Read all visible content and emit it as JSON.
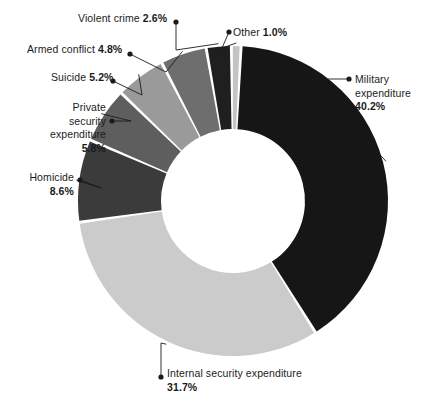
{
  "chart_data": {
    "type": "pie",
    "variant": "donut",
    "title": "",
    "subtitle": "",
    "xlabel": "",
    "ylabel": "",
    "units": "percent",
    "legend_position": "none",
    "grid": false,
    "label_style": "callout-with-leader-line-and-dot",
    "start_angle_deg": 3,
    "direction": "clockwise",
    "total": 99.9,
    "categories": [
      "Military expenditure",
      "Internal security expenditure",
      "Homicide",
      "Private security expenditure",
      "Suicide",
      "Armed conflict",
      "Violent crime",
      "Other"
    ],
    "values": [
      40.2,
      31.7,
      8.6,
      5.8,
      5.2,
      4.8,
      2.6,
      1.0
    ],
    "value_labels": [
      "40.2%",
      "31.7%",
      "8.6%",
      "5.8%",
      "5.2%",
      "4.8%",
      "2.6%",
      "1.0%"
    ],
    "colors": [
      "#161616",
      "#cbcbcb",
      "#3b3b3b",
      "#5e5e5e",
      "#9a9a9a",
      "#6e6e6e",
      "#1f1f1f",
      "#c4c4c4"
    ],
    "slices": [
      {
        "name": "Military expenditure",
        "value": 40.2,
        "value_label": "40.2%",
        "color": "#161616"
      },
      {
        "name": "Internal security expenditure",
        "value": 31.7,
        "value_label": "31.7%",
        "color": "#cbcbcb"
      },
      {
        "name": "Homicide",
        "value": 8.6,
        "value_label": "8.6%",
        "color": "#3b3b3b"
      },
      {
        "name": "Private security expenditure",
        "value": 5.8,
        "value_label": "5.8%",
        "color": "#5e5e5e"
      },
      {
        "name": "Suicide",
        "value": 5.2,
        "value_label": "5.2%",
        "color": "#9a9a9a"
      },
      {
        "name": "Armed conflict",
        "value": 4.8,
        "value_label": "4.8%",
        "color": "#6e6e6e"
      },
      {
        "name": "Violent crime",
        "value": 2.6,
        "value_label": "2.6%",
        "color": "#1f1f1f"
      },
      {
        "name": "Other",
        "value": 1.0,
        "value_label": "1.0%",
        "color": "#c4c4c4"
      }
    ]
  },
  "labels": {
    "military": {
      "name": "Military",
      "name2": "expenditure",
      "value": "40.2%"
    },
    "internal_security": {
      "name": "Internal security",
      "name2": "expenditure",
      "value": "31.7%"
    },
    "homicide": {
      "name": "Homicide",
      "value": "8.6%"
    },
    "private_security": {
      "name": "Private",
      "name2": "security",
      "name3": "expenditure",
      "value": "5.8%"
    },
    "suicide": {
      "name": "Suicide",
      "value": "5.2%"
    },
    "armed_conflict": {
      "name": "Armed conflict",
      "value": "4.8%"
    },
    "violent_crime": {
      "name": "Violent crime",
      "value": "2.6%"
    },
    "other": {
      "name": "Other",
      "value": "1.0%"
    }
  },
  "style": {
    "background": "#ffffff",
    "text_color": "#1b1b1b",
    "leader_line_color": "#1b1b1b",
    "dot_color": "#1b1b1b",
    "center_color": "#ffffff"
  },
  "geometry": {
    "cx": 233,
    "cy": 201,
    "outer_radius": 155,
    "inner_radius": 72
  }
}
